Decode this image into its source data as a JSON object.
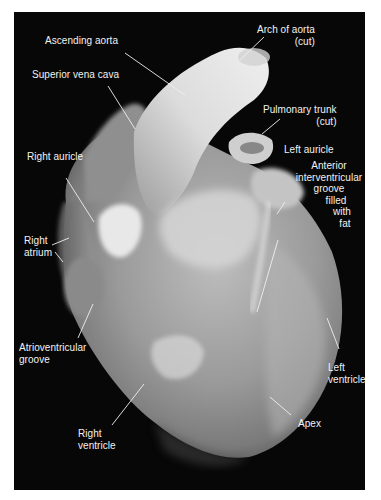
{
  "figure": {
    "background_color": "#070707",
    "label_color": "#f2f2f2",
    "labels": {
      "arch_of_aorta": [
        "Arch of aorta",
        "(cut)"
      ],
      "ascending_aorta": [
        "Ascending aorta"
      ],
      "superior_vena_cava": [
        "Superior vena cava"
      ],
      "pulmonary_trunk": [
        "Pulmonary trunk",
        "(cut)"
      ],
      "right_auricle": [
        "Right auricle"
      ],
      "left_auricle": [
        "Left auricle"
      ],
      "anterior_interventricular_groove": [
        "Anterior",
        "interventricular",
        "groove",
        "filled",
        "with",
        "fat"
      ],
      "right_atrium": [
        "Right",
        "atrium"
      ],
      "atrioventricular_groove": [
        "Atrioventricular",
        "groove"
      ],
      "left_ventricle": [
        "Left",
        "ventricle"
      ],
      "right_ventricle": [
        "Right",
        "ventricle"
      ],
      "apex": [
        "Apex"
      ]
    }
  }
}
